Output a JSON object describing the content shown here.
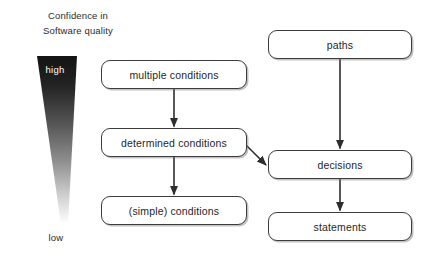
{
  "diagram": {
    "background": "#ffffff",
    "line_color": "#3c3c3c",
    "text_color": "#1f1f1f"
  },
  "legend": {
    "caption_line1": "Confidence in",
    "caption_line2": "Software quality",
    "high_label": "high",
    "low_label": "low",
    "gradient_top_color": "#151515",
    "gradient_bottom_color": "#ffffff",
    "shape": "tapered-wedge"
  },
  "nodes": [
    {
      "id": "multiple-conditions",
      "label": "multiple conditions",
      "column": "left"
    },
    {
      "id": "determined-conditions",
      "label": "determined conditions",
      "column": "left"
    },
    {
      "id": "simple-conditions",
      "label": "(simple) conditions",
      "column": "left"
    },
    {
      "id": "paths",
      "label": "paths",
      "column": "right"
    },
    {
      "id": "decisions",
      "label": "decisions",
      "column": "right"
    },
    {
      "id": "statements",
      "label": "statements",
      "column": "right"
    }
  ],
  "edges": [
    {
      "from": "multiple-conditions",
      "to": "determined-conditions",
      "style": "vertical-arrow"
    },
    {
      "from": "determined-conditions",
      "to": "simple-conditions",
      "style": "vertical-arrow"
    },
    {
      "from": "determined-conditions",
      "to": "decisions",
      "style": "diagonal-arrow"
    },
    {
      "from": "paths",
      "to": "decisions",
      "style": "vertical-arrow"
    },
    {
      "from": "decisions",
      "to": "statements",
      "style": "vertical-arrow"
    }
  ]
}
